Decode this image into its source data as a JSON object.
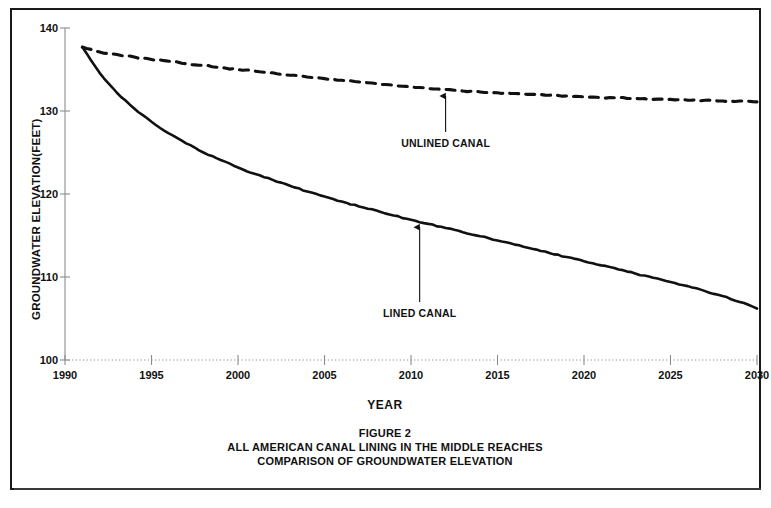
{
  "figure": {
    "caption_lines": [
      "FIGURE 2",
      "ALL AMERICAN CANAL LINING IN THE MIDDLE REACHES",
      "COMPARISON OF GROUNDWATER ELEVATION"
    ],
    "border_color": "#1a1a1a"
  },
  "chart_data": {
    "type": "line",
    "title": "FIGURE 2 ALL AMERICAN CANAL LINING IN THE MIDDLE REACHES COMPARISON OF GROUNDWATER ELEVATION",
    "xlabel": "YEAR",
    "ylabel": "GROUNDWATER ELEVATION(FEET)",
    "xlim": [
      1990,
      2030
    ],
    "ylim": [
      100,
      140
    ],
    "xticks": [
      1990,
      1995,
      2000,
      2005,
      2010,
      2015,
      2020,
      2025,
      2030
    ],
    "yticks": [
      100,
      110,
      120,
      130,
      140
    ],
    "xtick_labels": [
      "1990",
      "1995",
      "2000",
      "2005",
      "2010",
      "2015",
      "2020",
      "2025",
      "2030"
    ],
    "ytick_labels": [
      "100",
      "110",
      "120",
      "130",
      "140"
    ],
    "grid": false,
    "legend": "none (inline arrow annotations)",
    "x": [
      1991,
      1992,
      1993,
      1994,
      1995,
      1996,
      1997,
      1998,
      1999,
      2000,
      2001,
      2002,
      2003,
      2004,
      2005,
      2006,
      2007,
      2008,
      2009,
      2010,
      2011,
      2012,
      2013,
      2014,
      2015,
      2016,
      2017,
      2018,
      2019,
      2020,
      2021,
      2022,
      2023,
      2024,
      2025,
      2026,
      2027,
      2028,
      2029,
      2030
    ],
    "series": [
      {
        "name": "UNLINED CANAL",
        "style": "dashed",
        "color": "#111111",
        "values": [
          137.7,
          137.1,
          136.8,
          136.5,
          136.2,
          136.0,
          135.7,
          135.5,
          135.2,
          135.0,
          134.8,
          134.6,
          134.3,
          134.1,
          133.9,
          133.7,
          133.5,
          133.3,
          133.1,
          132.9,
          132.7,
          132.6,
          132.4,
          132.3,
          132.2,
          132.1,
          132.0,
          131.9,
          131.8,
          131.7,
          131.6,
          131.6,
          131.5,
          131.4,
          131.4,
          131.3,
          131.3,
          131.2,
          131.2,
          131.1
        ]
      },
      {
        "name": "LINED CANAL",
        "style": "solid",
        "color": "#111111",
        "values": [
          137.7,
          134.6,
          132.2,
          130.3,
          128.7,
          127.3,
          126.1,
          125.0,
          124.1,
          123.2,
          122.4,
          121.7,
          121.0,
          120.3,
          119.7,
          119.1,
          118.5,
          118.0,
          117.4,
          116.9,
          116.4,
          115.9,
          115.4,
          114.9,
          114.4,
          113.9,
          113.4,
          112.9,
          112.4,
          111.9,
          111.4,
          110.9,
          110.4,
          109.9,
          109.4,
          108.9,
          108.3,
          107.7,
          107.0,
          106.2
        ]
      }
    ],
    "annotations": [
      {
        "label": "UNLINED CANAL",
        "x": 2012,
        "y_target": 132.4,
        "label_x": 2012,
        "label_y": 127.0
      },
      {
        "label": "LINED CANAL",
        "x": 2010.5,
        "y_target": 116.6,
        "label_x": 2010.5,
        "label_y": 106.5
      }
    ]
  }
}
